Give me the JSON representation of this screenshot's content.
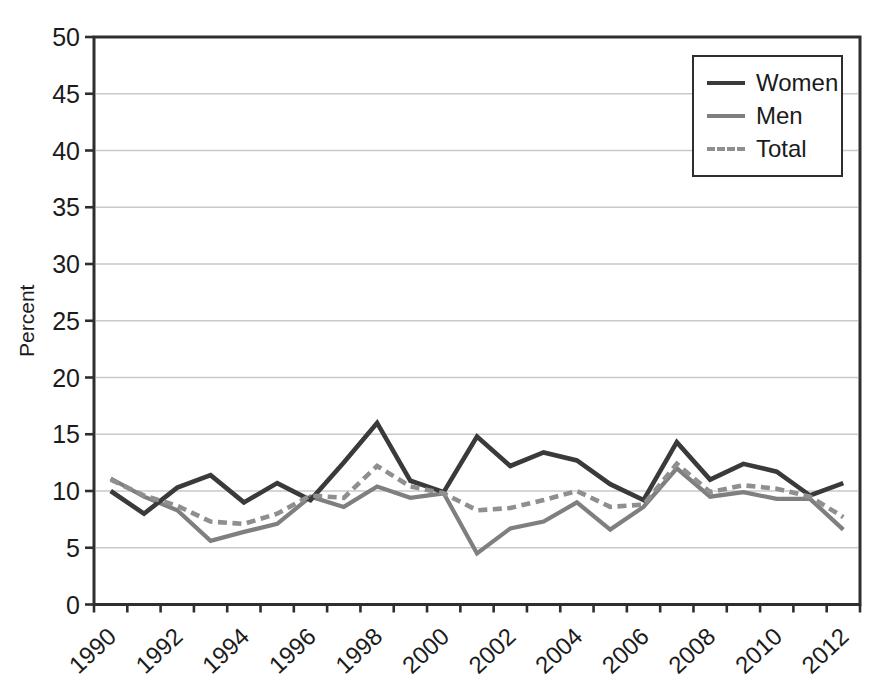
{
  "figure": {
    "background": "#ffffff"
  },
  "chart_data": {
    "type": "line",
    "title": "",
    "xlabel": "",
    "ylabel": "Percent",
    "ylim": [
      0,
      50
    ],
    "ytick_step": 5,
    "yticks": [
      "0",
      "5",
      "10",
      "15",
      "20",
      "25",
      "30",
      "35",
      "40",
      "45",
      "50"
    ],
    "x": [
      1990,
      1991,
      1992,
      1993,
      1994,
      1995,
      1996,
      1997,
      1998,
      1999,
      2000,
      2001,
      2002,
      2003,
      2004,
      2005,
      2006,
      2007,
      2008,
      2009,
      2010,
      2011,
      2012
    ],
    "xtick_labels": [
      "1990",
      "1992",
      "1994",
      "1996",
      "1998",
      "2000",
      "2002",
      "2004",
      "2006",
      "2008",
      "2010",
      "2012"
    ],
    "grid": "horizontal",
    "legend_position": "top-right",
    "series": [
      {
        "name": "Women",
        "color": "#3a3a3a",
        "style": "solid",
        "values": [
          10.0,
          8.0,
          10.3,
          11.4,
          9.0,
          10.7,
          9.2,
          12.5,
          16.0,
          10.9,
          9.9,
          14.8,
          12.2,
          13.4,
          12.7,
          10.6,
          9.2,
          14.3,
          11.0,
          12.4,
          11.7,
          9.6,
          10.7
        ]
      },
      {
        "name": "Men",
        "color": "#7f7f7f",
        "style": "solid",
        "values": [
          11.1,
          9.5,
          8.3,
          5.6,
          6.4,
          7.1,
          9.5,
          8.6,
          10.4,
          9.4,
          9.8,
          4.5,
          6.7,
          7.3,
          9.0,
          6.6,
          8.6,
          12.0,
          9.5,
          9.9,
          9.3,
          9.3,
          6.6
        ]
      },
      {
        "name": "Total",
        "color": "#8f8f8f",
        "style": "dashed",
        "values": [
          11.0,
          9.6,
          8.7,
          7.3,
          7.1,
          8.0,
          9.6,
          9.4,
          12.2,
          10.4,
          9.8,
          8.3,
          8.5,
          9.2,
          10.0,
          8.6,
          8.8,
          12.4,
          9.9,
          10.5,
          10.2,
          9.5,
          7.7
        ]
      }
    ]
  },
  "colors": {
    "axis": "#2e2e2e",
    "grid": "#c9c9c9",
    "text": "#1b1b1b"
  }
}
